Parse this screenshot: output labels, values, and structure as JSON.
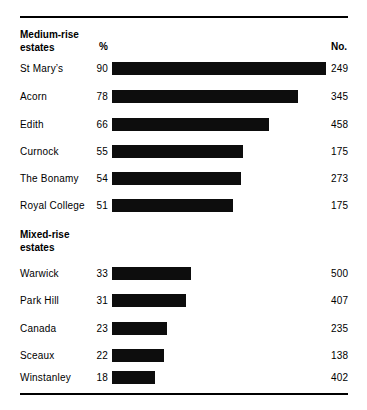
{
  "chart_data": {
    "type": "bar",
    "orientation": "horizontal",
    "title": "",
    "xlabel": "",
    "ylabel": "",
    "xlim": [
      0,
      100
    ],
    "grid": false,
    "legend": null,
    "columns": [
      "estate",
      "%",
      "No."
    ],
    "sections": [
      {
        "header_line1": "Medium-rise",
        "header_line2": "estates",
        "pct_header": "%",
        "no_header": "No.",
        "rows": [
          {
            "label": "St Mary’s",
            "percent": 90,
            "number": "249"
          },
          {
            "label": "Acorn",
            "percent": 78,
            "number": "345"
          },
          {
            "label": "Edith",
            "percent": 66,
            "number": "458"
          },
          {
            "label": "Curnock",
            "percent": 55,
            "number": "175"
          },
          {
            "label": "The Bonamy",
            "percent": 54,
            "number": "273"
          },
          {
            "label": "Royal College",
            "percent": 51,
            "number": "175"
          }
        ]
      },
      {
        "header_line1": "Mixed-rise",
        "header_line2": "estates",
        "pct_header": "",
        "no_header": "",
        "rows": [
          {
            "label": "Warwick",
            "percent": 33,
            "number": "500"
          },
          {
            "label": "Park Hill",
            "percent": 31,
            "number": "407"
          },
          {
            "label": "Canada",
            "percent": 23,
            "number": "235"
          },
          {
            "label": "Sceaux",
            "percent": 22,
            "number": "138"
          },
          {
            "label": "Winstanley",
            "percent": 18,
            "number": "402"
          }
        ]
      }
    ],
    "categories": [
      "St Mary’s",
      "Acorn",
      "Edith",
      "Curnock",
      "The Bonamy",
      "Royal College",
      "Warwick",
      "Park Hill",
      "Canada",
      "Sceaux",
      "Winstanley"
    ],
    "values": [
      90,
      78,
      66,
      55,
      54,
      51,
      33,
      31,
      23,
      22,
      18
    ],
    "counts": [
      249,
      345,
      458,
      175,
      273,
      175,
      500,
      407,
      235,
      138,
      402
    ],
    "bar_color": "#0d0d0d"
  },
  "layout": {
    "bar_left_px": 112,
    "bar_full_width_px": 238,
    "bar_height_px": 13,
    "section1_header_y": 28,
    "section1_rows_y": [
      63,
      91,
      119,
      146,
      173,
      200
    ],
    "section2_header_y": 228,
    "section2_rows_y": [
      268,
      295,
      323,
      350,
      372
    ]
  }
}
